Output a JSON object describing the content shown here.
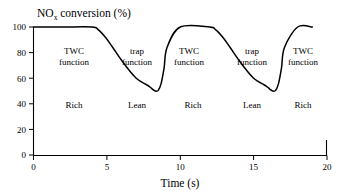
{
  "figure": {
    "title_main": "NO",
    "title_sub": "x",
    "title_rest": " conversion (%)",
    "title_full": "NOx conversion (%)"
  },
  "chart_data": {
    "type": "line",
    "title": "NOx conversion (%)",
    "xlabel": "Time (s)",
    "ylabel": "NOx conversion (%)",
    "xlim": [
      0,
      20
    ],
    "ylim": [
      0,
      100
    ],
    "xticks": [
      0,
      5,
      10,
      15,
      20
    ],
    "xtick_labels": [
      "0",
      "5",
      "10",
      "15",
      "20"
    ],
    "yticks": [
      0,
      20,
      40,
      60,
      80,
      100
    ],
    "ytick_labels": [
      "0",
      "20",
      "40",
      "60",
      "80",
      "100"
    ],
    "grid": false,
    "legend": "none",
    "series": [
      {
        "name": "NOx conversion",
        "color": "#000000",
        "x": [
          0.0,
          2.0,
          4.0,
          4.4,
          4.9,
          5.4,
          6.0,
          6.6,
          7.0,
          7.3,
          7.6,
          7.9,
          8.1,
          8.3,
          8.5,
          8.7,
          8.9,
          9.1,
          10.0,
          12.0,
          12.4,
          12.9,
          13.4,
          14.0,
          14.6,
          15.0,
          15.3,
          15.6,
          15.9,
          16.1,
          16.3,
          16.5,
          16.7,
          16.9,
          17.1,
          18.0,
          19.0
        ],
        "y": [
          100,
          100,
          100,
          98,
          92,
          84,
          74,
          65,
          60,
          57.5,
          55.5,
          53.5,
          51.5,
          50,
          50.5,
          56,
          68,
          84,
          100,
          100,
          98,
          92,
          84,
          74,
          65,
          60,
          57.5,
          55.5,
          53.5,
          51.5,
          50,
          50.5,
          56,
          68,
          84,
          100,
          100
        ]
      }
    ],
    "annotations": [
      {
        "text": "TWC",
        "x": 2.8,
        "y": 80,
        "name": "twc-function-label-1"
      },
      {
        "text": "function",
        "x": 2.8,
        "y": 72,
        "name": "twc-function-label-1-line2"
      },
      {
        "text": "trap",
        "x": 7.1,
        "y": 80,
        "name": "trap-function-label-1"
      },
      {
        "text": "function",
        "x": 7.1,
        "y": 72,
        "name": "trap-function-label-1-line2"
      },
      {
        "text": "TWC",
        "x": 10.6,
        "y": 80,
        "name": "twc-function-label-2"
      },
      {
        "text": "function",
        "x": 10.6,
        "y": 72,
        "name": "twc-function-label-2-line2"
      },
      {
        "text": "trap",
        "x": 14.9,
        "y": 80,
        "name": "trap-function-label-2"
      },
      {
        "text": "function",
        "x": 14.9,
        "y": 72,
        "name": "trap-function-label-2-line2"
      },
      {
        "text": "TWC",
        "x": 18.4,
        "y": 80,
        "name": "twc-function-label-3"
      },
      {
        "text": "function",
        "x": 18.4,
        "y": 72,
        "name": "twc-function-label-3-line2"
      },
      {
        "text": "Rich",
        "x": 2.8,
        "y": 39,
        "name": "rich-label-1"
      },
      {
        "text": "Lean",
        "x": 7.1,
        "y": 39,
        "name": "lean-label-1"
      },
      {
        "text": "Rich",
        "x": 10.9,
        "y": 39,
        "name": "rich-label-2"
      },
      {
        "text": "Lean",
        "x": 14.9,
        "y": 39,
        "name": "lean-label-2"
      },
      {
        "text": "Rich",
        "x": 18.4,
        "y": 39,
        "name": "rich-label-3"
      }
    ]
  },
  "labels": {
    "x_axis_title": "Time (s)",
    "twc": "TWC",
    "trap": "trap",
    "function": "function",
    "rich": "Rich",
    "lean": "Lean"
  }
}
